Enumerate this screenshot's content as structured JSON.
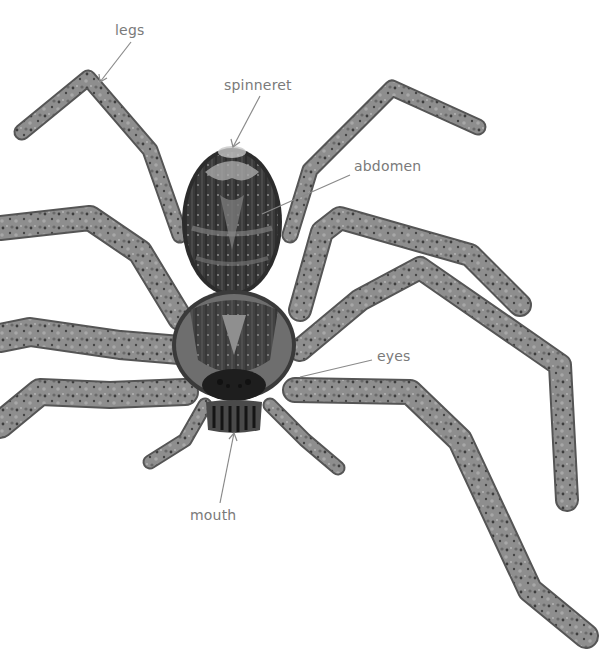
{
  "diagram": {
    "colors": {
      "background": "#ffffff",
      "label_text": "#7a7a7a",
      "pointer_line": "#8a8a8a",
      "leg_fill": "#8c8c8c",
      "leg_dark": "#4a4a4a",
      "body_dark": "#2e2e2e",
      "body_mid": "#6e6e6e",
      "body_light": "#b5b5b5"
    },
    "labels": [
      {
        "id": "legs",
        "text": "legs",
        "x": 115,
        "y": 22,
        "pointer_from": [
          131,
          42
        ],
        "pointer_to": [
          100,
          82
        ]
      },
      {
        "id": "spinneret",
        "text": "spinneret",
        "x": 224,
        "y": 77,
        "pointer_from": [
          260,
          96
        ],
        "pointer_to": [
          233,
          147
        ]
      },
      {
        "id": "abdomen",
        "text": "abdomen",
        "x": 354,
        "y": 158,
        "pointer_from": [
          350,
          175
        ],
        "pointer_to": [
          262,
          214
        ]
      },
      {
        "id": "eyes",
        "text": "eyes",
        "x": 377,
        "y": 348,
        "pointer_from": [
          372,
          360
        ],
        "pointer_to": [
          300,
          377
        ]
      },
      {
        "id": "mouth",
        "text": "mouth",
        "x": 190,
        "y": 507,
        "pointer_from": [
          220,
          503
        ],
        "pointer_to": [
          234,
          433
        ]
      }
    ]
  }
}
